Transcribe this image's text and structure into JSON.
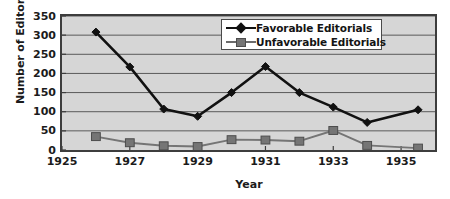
{
  "chart_data": {
    "type": "line",
    "title": "",
    "xlabel": "Year",
    "ylabel": "Number of Editorials",
    "xlim": [
      1925,
      1936
    ],
    "ylim": [
      0,
      350
    ],
    "ytick_values": [
      0,
      50,
      100,
      150,
      200,
      250,
      300,
      350
    ],
    "ytick_labels": [
      "0",
      "50",
      "100",
      "150",
      "200",
      "250",
      "300",
      "350"
    ],
    "xtick_values": [
      1925,
      1927,
      1929,
      1931,
      1933,
      1935
    ],
    "xtick_labels": [
      "1925",
      "1927",
      "1929",
      "1931",
      "1933",
      "1935"
    ],
    "grid": "horizontal",
    "legend_position": "upper right",
    "plot_background": "#d6d6d6",
    "x": [
      1926,
      1927,
      1928,
      1929,
      1930,
      1931,
      1932,
      1933,
      1934,
      1935.5
    ],
    "series": [
      {
        "name": "Favorable Editorials",
        "color": "#111111",
        "marker": "diamond",
        "values": [
          308,
          217,
          107,
          88,
          150,
          218,
          150,
          112,
          72,
          105
        ]
      },
      {
        "name": "Unfavorable Editorials",
        "color": "#757575",
        "marker": "square",
        "values": [
          35,
          19,
          11,
          9,
          27,
          26,
          23,
          51,
          12,
          5
        ]
      }
    ]
  },
  "legend": {
    "items": [
      {
        "label": "Favorable Editorials",
        "marker": "diamond-marker"
      },
      {
        "label": "Unfavorable Editorials",
        "marker": "square-marker"
      }
    ]
  }
}
